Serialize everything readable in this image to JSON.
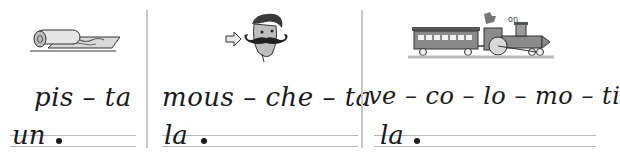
{
  "panels": [
    {
      "illustration": "rolled-carpet-icon",
      "syllables": "pis – ta",
      "article": "un",
      "answer_line": ""
    },
    {
      "illustration": "mustache-man-icon",
      "syllables": "mous – che – ta",
      "article": "la",
      "answer_line": ""
    },
    {
      "illustration": "train-locomotive-icon",
      "syllables": "ve – co – lo – mo – ti",
      "article": "la",
      "answer_line": ""
    }
  ],
  "colors": {
    "ink": "#1b1b1b",
    "rule": "#b9b9b9",
    "divider": "#c8c8c8",
    "illustration_gray": "#7a7a7a"
  }
}
